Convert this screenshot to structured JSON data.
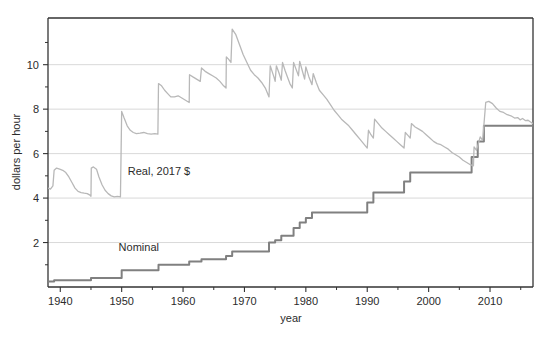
{
  "chart_data": {
    "type": "line",
    "title": "",
    "xlabel": "year",
    "ylabel": "dollars per hour",
    "xlim": [
      1938,
      2017
    ],
    "ylim": [
      0,
      12.1
    ],
    "grid": true,
    "grid_axis": "y",
    "legend": "inline-annotations",
    "xticks": [
      1940,
      1950,
      1960,
      1970,
      1980,
      1990,
      2000,
      2010
    ],
    "xtick_labels": [
      "1940",
      "1950",
      "1960",
      "1970",
      "1980",
      "1990",
      "2000",
      "2010"
    ],
    "x_minor_ticks": [
      1945,
      1955,
      1965,
      1975,
      1985,
      1995,
      2005,
      2015
    ],
    "yticks": [
      2,
      4,
      6,
      8,
      10
    ],
    "ytick_labels": [
      "2",
      "4",
      "6",
      "8",
      "10"
    ],
    "y_minor_ticks": [
      1,
      3,
      5,
      7,
      9,
      11
    ],
    "colors": {
      "nominal": "#808080",
      "real": "#b8b8b8",
      "grid": "#d9d9d9",
      "axis": "#333333",
      "text": "#2b2b2b"
    },
    "series": [
      {
        "name": "Nominal",
        "label": "Nominal",
        "label_x": 1949.5,
        "label_y": 1.62,
        "color": "#808080",
        "width": 2.0,
        "step": true,
        "points": [
          [
            1938,
            0.25
          ],
          [
            1939,
            0.3
          ],
          [
            1945,
            0.4
          ],
          [
            1950,
            0.75
          ],
          [
            1956,
            1.0
          ],
          [
            1961,
            1.15
          ],
          [
            1963,
            1.25
          ],
          [
            1967,
            1.4
          ],
          [
            1968,
            1.6
          ],
          [
            1974,
            2.0
          ],
          [
            1975,
            2.1
          ],
          [
            1976,
            2.3
          ],
          [
            1978,
            2.65
          ],
          [
            1979,
            2.9
          ],
          [
            1980,
            3.1
          ],
          [
            1981,
            3.35
          ],
          [
            1990,
            3.8
          ],
          [
            1991,
            4.25
          ],
          [
            1996,
            4.75
          ],
          [
            1997,
            5.15
          ],
          [
            2007,
            5.85
          ],
          [
            2008,
            6.55
          ],
          [
            2009,
            7.25
          ],
          [
            2017,
            7.25
          ]
        ]
      },
      {
        "name": "Real, 2017 $",
        "label": "Real, 2017 $",
        "label_x": 1951.0,
        "label_y": 5.05,
        "color": "#b8b8b8",
        "width": 1.3,
        "step": false,
        "points": [
          [
            1938.0,
            4.45
          ],
          [
            1938.4,
            4.4
          ],
          [
            1938.8,
            4.55
          ],
          [
            1939.0,
            5.25
          ],
          [
            1939.4,
            5.35
          ],
          [
            1939.9,
            5.3
          ],
          [
            1940.4,
            5.25
          ],
          [
            1940.9,
            5.15
          ],
          [
            1941.4,
            4.95
          ],
          [
            1941.9,
            4.7
          ],
          [
            1942.4,
            4.45
          ],
          [
            1942.9,
            4.3
          ],
          [
            1943.4,
            4.25
          ],
          [
            1943.9,
            4.22
          ],
          [
            1944.4,
            4.2
          ],
          [
            1944.9,
            4.12
          ],
          [
            1945.0,
            4.08
          ],
          [
            1945.05,
            5.35
          ],
          [
            1945.4,
            5.4
          ],
          [
            1945.9,
            5.3
          ],
          [
            1946.3,
            4.95
          ],
          [
            1946.8,
            4.6
          ],
          [
            1947.3,
            4.35
          ],
          [
            1947.8,
            4.2
          ],
          [
            1948.3,
            4.1
          ],
          [
            1948.8,
            4.05
          ],
          [
            1949.3,
            4.08
          ],
          [
            1949.8,
            4.05
          ],
          [
            1950.0,
            7.9
          ],
          [
            1950.4,
            7.6
          ],
          [
            1950.9,
            7.25
          ],
          [
            1951.4,
            7.05
          ],
          [
            1951.9,
            6.95
          ],
          [
            1952.4,
            6.9
          ],
          [
            1953.0,
            6.92
          ],
          [
            1953.6,
            6.95
          ],
          [
            1954.2,
            6.9
          ],
          [
            1954.8,
            6.88
          ],
          [
            1955.4,
            6.9
          ],
          [
            1955.9,
            6.88
          ],
          [
            1956.0,
            9.15
          ],
          [
            1956.5,
            9.05
          ],
          [
            1957.0,
            8.85
          ],
          [
            1957.5,
            8.7
          ],
          [
            1958.0,
            8.55
          ],
          [
            1958.6,
            8.55
          ],
          [
            1959.2,
            8.6
          ],
          [
            1959.8,
            8.5
          ],
          [
            1960.4,
            8.4
          ],
          [
            1961.0,
            8.3
          ],
          [
            1961.05,
            9.55
          ],
          [
            1961.6,
            9.45
          ],
          [
            1962.2,
            9.35
          ],
          [
            1962.8,
            9.25
          ],
          [
            1963.0,
            9.85
          ],
          [
            1963.6,
            9.7
          ],
          [
            1964.2,
            9.6
          ],
          [
            1964.8,
            9.5
          ],
          [
            1965.4,
            9.4
          ],
          [
            1966.0,
            9.25
          ],
          [
            1966.6,
            9.05
          ],
          [
            1967.0,
            8.95
          ],
          [
            1967.05,
            10.35
          ],
          [
            1967.4,
            10.25
          ],
          [
            1967.8,
            10.1
          ],
          [
            1968.0,
            11.6
          ],
          [
            1968.6,
            11.35
          ],
          [
            1969.2,
            10.9
          ],
          [
            1969.8,
            10.45
          ],
          [
            1970.4,
            10.1
          ],
          [
            1971.0,
            9.75
          ],
          [
            1971.6,
            9.55
          ],
          [
            1972.2,
            9.4
          ],
          [
            1972.8,
            9.2
          ],
          [
            1973.4,
            8.95
          ],
          [
            1974.0,
            8.55
          ],
          [
            1974.2,
            9.95
          ],
          [
            1974.5,
            9.7
          ],
          [
            1974.8,
            9.45
          ],
          [
            1975.0,
            9.25
          ],
          [
            1975.2,
            9.95
          ],
          [
            1975.6,
            9.65
          ],
          [
            1976.0,
            9.3
          ],
          [
            1976.2,
            10.1
          ],
          [
            1976.6,
            9.75
          ],
          [
            1977.0,
            9.45
          ],
          [
            1977.4,
            9.15
          ],
          [
            1977.8,
            8.95
          ],
          [
            1978.0,
            10.1
          ],
          [
            1978.4,
            9.8
          ],
          [
            1978.8,
            9.5
          ],
          [
            1979.0,
            10.15
          ],
          [
            1979.4,
            9.75
          ],
          [
            1979.8,
            9.35
          ],
          [
            1980.0,
            9.9
          ],
          [
            1980.5,
            9.45
          ],
          [
            1981.0,
            9.1
          ],
          [
            1981.2,
            9.6
          ],
          [
            1981.7,
            9.2
          ],
          [
            1982.2,
            8.85
          ],
          [
            1982.8,
            8.65
          ],
          [
            1983.4,
            8.45
          ],
          [
            1984.0,
            8.2
          ],
          [
            1984.6,
            7.95
          ],
          [
            1985.2,
            7.75
          ],
          [
            1985.8,
            7.55
          ],
          [
            1986.4,
            7.4
          ],
          [
            1987.0,
            7.25
          ],
          [
            1987.6,
            7.05
          ],
          [
            1988.2,
            6.85
          ],
          [
            1988.8,
            6.65
          ],
          [
            1989.4,
            6.45
          ],
          [
            1990.0,
            6.25
          ],
          [
            1990.2,
            7.05
          ],
          [
            1990.6,
            6.85
          ],
          [
            1991.0,
            6.7
          ],
          [
            1991.2,
            7.55
          ],
          [
            1991.8,
            7.35
          ],
          [
            1992.4,
            7.15
          ],
          [
            1993.0,
            7.0
          ],
          [
            1993.6,
            6.85
          ],
          [
            1994.2,
            6.7
          ],
          [
            1994.8,
            6.55
          ],
          [
            1995.4,
            6.4
          ],
          [
            1996.0,
            6.25
          ],
          [
            1996.2,
            6.95
          ],
          [
            1996.7,
            6.8
          ],
          [
            1997.0,
            6.7
          ],
          [
            1997.2,
            7.35
          ],
          [
            1997.8,
            7.2
          ],
          [
            1998.4,
            7.1
          ],
          [
            1999.0,
            7.0
          ],
          [
            1999.6,
            6.85
          ],
          [
            2000.2,
            6.7
          ],
          [
            2000.8,
            6.55
          ],
          [
            2001.4,
            6.45
          ],
          [
            2002.0,
            6.4
          ],
          [
            2002.6,
            6.3
          ],
          [
            2003.2,
            6.2
          ],
          [
            2003.8,
            6.05
          ],
          [
            2004.4,
            5.95
          ],
          [
            2005.0,
            5.85
          ],
          [
            2005.6,
            5.7
          ],
          [
            2006.2,
            5.6
          ],
          [
            2006.8,
            5.5
          ],
          [
            2007.3,
            5.45
          ],
          [
            2007.4,
            6.3
          ],
          [
            2007.8,
            6.15
          ],
          [
            2008.4,
            6.75
          ],
          [
            2008.8,
            6.6
          ],
          [
            2009.3,
            8.3
          ],
          [
            2009.8,
            8.35
          ],
          [
            2010.4,
            8.25
          ],
          [
            2011.0,
            8.05
          ],
          [
            2011.6,
            7.9
          ],
          [
            2012.2,
            7.85
          ],
          [
            2012.8,
            7.75
          ],
          [
            2013.4,
            7.7
          ],
          [
            2014.0,
            7.6
          ],
          [
            2014.5,
            7.62
          ],
          [
            2014.9,
            7.52
          ],
          [
            2015.3,
            7.58
          ],
          [
            2015.8,
            7.48
          ],
          [
            2016.2,
            7.5
          ],
          [
            2016.6,
            7.42
          ],
          [
            2017.0,
            7.35
          ]
        ]
      }
    ]
  }
}
